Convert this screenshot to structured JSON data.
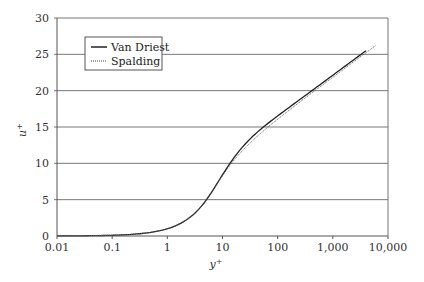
{
  "chart_data": {
    "type": "line",
    "title": "",
    "xlabel": "y+",
    "ylabel": "u+",
    "xscale": "log",
    "xlim": [
      0.01,
      10000
    ],
    "ylim": [
      0,
      30
    ],
    "x_ticks": [
      "0.01",
      "0.1",
      "1",
      "10",
      "100",
      "1,000",
      "10,000"
    ],
    "y_ticks": [
      "0",
      "5",
      "10",
      "15",
      "20",
      "25",
      "30"
    ],
    "grid": "horizontal",
    "legend_position": "upper-left",
    "series": [
      {
        "name": "Van Driest",
        "style": "solid",
        "x": [
          0.01,
          0.1,
          1,
          2,
          5,
          10,
          20,
          50,
          100,
          1000,
          4000
        ],
        "y": [
          0.01,
          0.1,
          1.0,
          2.0,
          4.6,
          8.7,
          12.6,
          15.6,
          17.3,
          22.9,
          26.3
        ]
      },
      {
        "name": "Spalding",
        "style": "dotted",
        "x": [
          0.01,
          0.1,
          1,
          2,
          5,
          10,
          20,
          50,
          100,
          1000,
          4000
        ],
        "y": [
          0.01,
          0.1,
          1.0,
          2.0,
          4.6,
          8.5,
          12.2,
          15.3,
          17.2,
          22.9,
          26.3
        ]
      }
    ]
  },
  "labels": {
    "xlabel_main": "y",
    "xlabel_sup": "+",
    "ylabel_main": "u",
    "ylabel_sup": "+",
    "legend": [
      "Van Driest",
      "Spalding"
    ]
  }
}
